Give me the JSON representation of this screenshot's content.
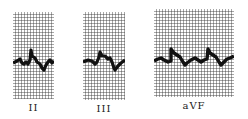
{
  "figure": {
    "leads": [
      {
        "label": "II"
      },
      {
        "label": "III"
      },
      {
        "label": "aVF"
      }
    ]
  },
  "colors": {
    "grid": "#3a3a3a",
    "background": "#ffffff",
    "trace": "#111111"
  }
}
